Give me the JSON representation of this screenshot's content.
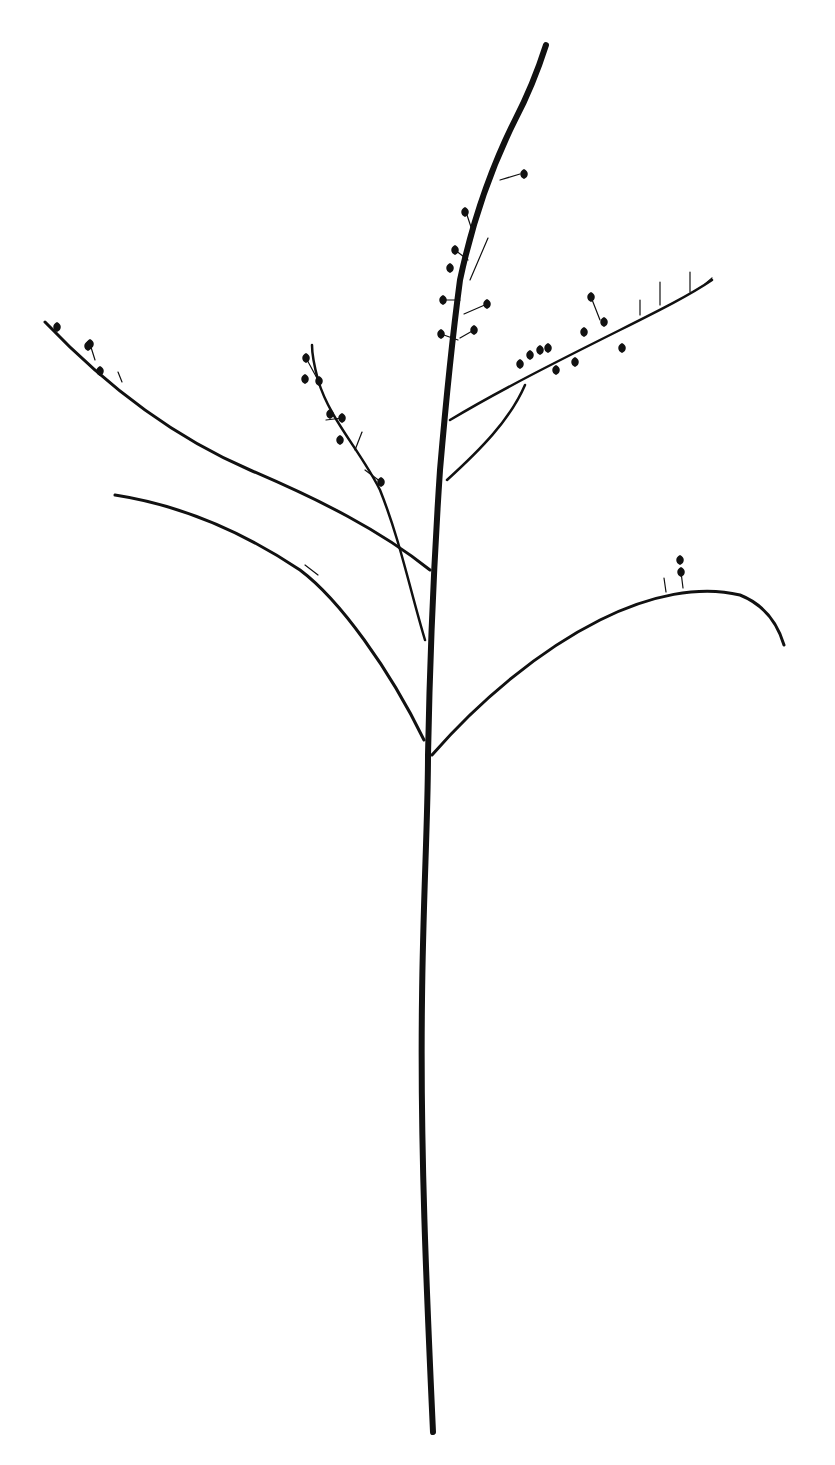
{
  "image": {
    "subject": "Dried plant stem silhouette with branching seed-pod racemes",
    "background": "#ffffff",
    "ink": "#111111",
    "width": 835,
    "height": 1465
  },
  "stem": {
    "main": "M433 1432 C427 1300 420 1150 422 1000 C423 900 428 820 428 755 C430 650 434 560 440 470 C446 400 452 340 460 280 C475 210 495 160 515 120 C528 95 538 70 546 45",
    "main_width": 6
  },
  "branches": [
    {
      "name": "left-upper-branch",
      "d": "M430 570 C380 530 320 500 250 470 C180 440 110 390 45 322",
      "w": 3
    },
    {
      "name": "left-lower-branch",
      "d": "M424 740 C390 670 340 600 300 570 C240 530 180 505 115 495",
      "w": 3
    },
    {
      "name": "mid-left-raceme",
      "d": "M425 640 C410 590 400 540 380 490 C360 450 330 420 318 380 C314 365 312 355 312 345",
      "w": 2.5
    },
    {
      "name": "right-upper-raceme-a",
      "d": "M450 420 C500 390 560 360 620 330 C660 310 690 295 712 280",
      "w": 2.5
    },
    {
      "name": "right-upper-raceme-b",
      "d": "M447 480 C480 450 510 420 525 385",
      "w": 2.5
    },
    {
      "name": "right-lower-branch",
      "d": "M432 755 C480 700 540 650 600 620 C650 595 700 585 740 595 C765 605 778 625 784 645",
      "w": 3
    }
  ],
  "pods": [
    [
      524,
      174
    ],
    [
      465,
      212
    ],
    [
      455,
      250
    ],
    [
      450,
      268
    ],
    [
      443,
      300
    ],
    [
      487,
      304
    ],
    [
      441,
      334
    ],
    [
      474,
      330
    ],
    [
      306,
      358
    ],
    [
      319,
      381
    ],
    [
      305,
      379
    ],
    [
      330,
      414
    ],
    [
      340,
      440
    ],
    [
      381,
      482
    ],
    [
      342,
      418
    ],
    [
      90,
      344
    ],
    [
      57,
      327
    ],
    [
      100,
      371
    ],
    [
      88,
      346
    ],
    [
      591,
      297
    ],
    [
      520,
      364
    ],
    [
      530,
      355
    ],
    [
      540,
      350
    ],
    [
      548,
      348
    ],
    [
      556,
      370
    ],
    [
      584,
      332
    ],
    [
      622,
      348
    ],
    [
      575,
      362
    ],
    [
      604,
      322
    ],
    [
      680,
      560
    ],
    [
      681,
      572
    ]
  ],
  "twigs": [
    {
      "d": "M500 180 L520 174"
    },
    {
      "d": "M472 230 L466 212"
    },
    {
      "d": "M468 260 L455 250"
    },
    {
      "d": "M470 280 L488 238"
    },
    {
      "d": "M460 300 L443 300"
    },
    {
      "d": "M464 314 L487 304"
    },
    {
      "d": "M458 340 L441 334"
    },
    {
      "d": "M460 338 L474 330"
    },
    {
      "d": "M318 380 L306 358"
    },
    {
      "d": "M326 420 L342 418"
    },
    {
      "d": "M355 450 L362 432"
    },
    {
      "d": "M365 470 L381 482"
    },
    {
      "d": "M95 360 L90 344"
    },
    {
      "d": "M122 382 L118 372"
    },
    {
      "d": "M600 320 L591 297"
    },
    {
      "d": "M660 305 L660 282"
    },
    {
      "d": "M690 292 L690 272"
    },
    {
      "d": "M705 284 L712 278"
    },
    {
      "d": "M640 315 L640 300"
    },
    {
      "d": "M666 592 L664 578"
    },
    {
      "d": "M683 588 L681 572"
    },
    {
      "d": "M318 575 L305 565"
    }
  ]
}
